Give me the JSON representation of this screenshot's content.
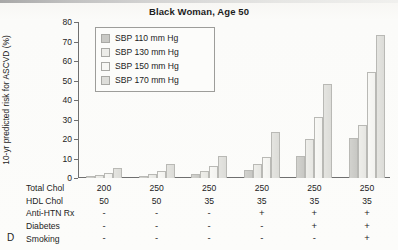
{
  "figure": {
    "panel_letter": "D",
    "title": "Black Woman, Age 50",
    "ylabel": "10-yr predicted risk for ASCVD (%)"
  },
  "legend": {
    "items": [
      {
        "label": "SBP 110 mm Hg",
        "color": "#c9c9c5"
      },
      {
        "label": "SBP 130 mm Hg",
        "color": "#ececE8"
      },
      {
        "label": "SBP 150 mm Hg",
        "color": "#f7f7f4"
      },
      {
        "label": "SBP 170 mm Hg",
        "color": "#dededa"
      }
    ]
  },
  "yaxis": {
    "ticks": [
      "0",
      "10",
      "20",
      "30",
      "40",
      "50",
      "60",
      "70",
      "80"
    ]
  },
  "table": {
    "rows": [
      {
        "label": "Total Chol",
        "values": [
          "200",
          "250",
          "250",
          "250",
          "250",
          "250"
        ]
      },
      {
        "label": "HDL Chol",
        "values": [
          "50",
          "50",
          "35",
          "35",
          "35",
          "35"
        ]
      },
      {
        "label": "Anti-HTN Rx",
        "values": [
          "-",
          "-",
          "-",
          "+",
          "+",
          "+"
        ]
      },
      {
        "label": "Diabetes",
        "values": [
          "-",
          "-",
          "-",
          "-",
          "+",
          "+"
        ]
      },
      {
        "label": "Smoking",
        "values": [
          "-",
          "-",
          "-",
          "-",
          "-",
          "+"
        ]
      }
    ]
  },
  "chart_data": {
    "type": "bar",
    "title": "Black Woman, Age 50",
    "xlabel": "",
    "ylabel": "10-yr predicted risk for ASCVD (%)",
    "ylim": [
      0,
      80
    ],
    "yticks": [
      0,
      10,
      20,
      30,
      40,
      50,
      60,
      70,
      80
    ],
    "grid": false,
    "legend_position": "upper-left-inset",
    "categories": [
      "TC 200 / HDL 50",
      "TC 250 / HDL 50",
      "TC 250 / HDL 35",
      "TC 250 / HDL 35 / Anti-HTN Rx",
      "TC 250 / HDL 35 / Anti-HTN Rx / Diabetes",
      "TC 250 / HDL 35 / Anti-HTN Rx / Diabetes / Smoking"
    ],
    "series": [
      {
        "name": "SBP 110 mm Hg",
        "values": [
          0.8,
          1.2,
          2.0,
          4.0,
          11.5,
          20.5
        ]
      },
      {
        "name": "SBP 130 mm Hg",
        "values": [
          1.5,
          2.0,
          3.5,
          7.0,
          20.0,
          27.0
        ]
      },
      {
        "name": "SBP 150 mm Hg",
        "values": [
          2.5,
          3.5,
          6.0,
          11.0,
          31.5,
          54.5
        ]
      },
      {
        "name": "SBP 170 mm Hg",
        "values": [
          5.0,
          7.0,
          11.5,
          23.5,
          48.0,
          73.5
        ]
      }
    ]
  }
}
